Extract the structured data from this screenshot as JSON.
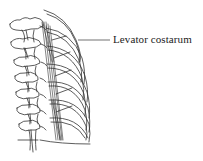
{
  "figure": {
    "labels": [
      {
        "text": "Levator costarum",
        "points_to": "levator-costarum-muscle"
      }
    ]
  },
  "colors": {
    "line": "#333333",
    "background": "#ffffff",
    "text": "#222222"
  }
}
